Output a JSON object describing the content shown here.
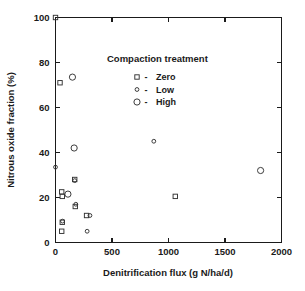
{
  "chart_data": {
    "type": "scatter",
    "title": "",
    "xlabel": "Denitrification flux (g N/ha/d)",
    "ylabel": "Nitrous oxide fraction (%)",
    "xlim": [
      0,
      2000
    ],
    "ylim": [
      0,
      100
    ],
    "xticks": [
      0,
      500,
      1000,
      1500,
      2000
    ],
    "yticks": [
      0,
      20,
      40,
      60,
      80,
      100
    ],
    "xtick_labels": [
      "0",
      "500",
      "1000",
      "1500",
      "2000"
    ],
    "ytick_labels": [
      "0",
      "20",
      "40",
      "60",
      "80",
      "100"
    ],
    "grid": false,
    "legend_position": "upper-center",
    "legend_title": "Compaction treatment",
    "series": [
      {
        "name": "Zero",
        "marker": "square",
        "points": [
          {
            "x": 40,
            "y": 71
          },
          {
            "x": 55,
            "y": 22.5
          },
          {
            "x": 60,
            "y": 20.5
          },
          {
            "x": 170,
            "y": 28
          },
          {
            "x": 175,
            "y": 16
          },
          {
            "x": 60,
            "y": 9
          },
          {
            "x": 55,
            "y": 5
          },
          {
            "x": 275,
            "y": 12
          },
          {
            "x": 1060,
            "y": 20.5
          },
          {
            "x": 0,
            "y": 100
          }
        ]
      },
      {
        "name": "Low",
        "marker": "circle-small",
        "points": [
          {
            "x": 0,
            "y": 33.5
          },
          {
            "x": 170,
            "y": 27.5
          },
          {
            "x": 180,
            "y": 17
          },
          {
            "x": 62,
            "y": 9.5
          },
          {
            "x": 305,
            "y": 12
          },
          {
            "x": 280,
            "y": 5
          },
          {
            "x": 870,
            "y": 45
          }
        ]
      },
      {
        "name": "High",
        "marker": "circle-large",
        "points": [
          {
            "x": 150,
            "y": 73.5
          },
          {
            "x": 165,
            "y": 42
          },
          {
            "x": 110,
            "y": 21.5
          },
          {
            "x": 1815,
            "y": 32
          }
        ]
      }
    ]
  },
  "legend": {
    "title": "Compaction treatment",
    "separator": "-",
    "entries": [
      {
        "label": "Zero",
        "marker": "square"
      },
      {
        "label": "Low",
        "marker": "circle-small"
      },
      {
        "label": "High",
        "marker": "circle-large"
      }
    ]
  },
  "colors": {
    "background": "#ffffff",
    "axis": "#1a1a1a",
    "marker": "#333333"
  }
}
